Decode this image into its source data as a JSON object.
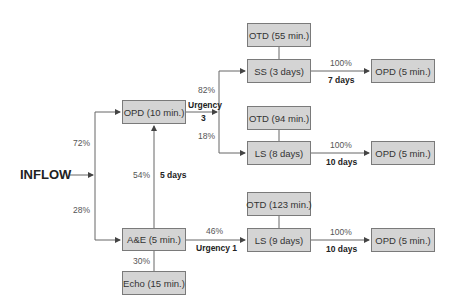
{
  "diagram": {
    "inflow_label": "INFLOW",
    "nodes": {
      "opd_main": "OPD (10 min.)",
      "ae": "A&E (5 min.)",
      "echo": "Echo (15 min.)",
      "otd_55": "OTD (55 min.)",
      "ss": "SS (3 days)",
      "otd_94": "OTD (94 min.)",
      "ls_8": "LS (8 days)",
      "otd_123": "OTD (123 min.)",
      "ls_9": "LS (9 days)",
      "opd_5_a": "OPD (5 min.)",
      "opd_5_b": "OPD (5 min.)",
      "opd_5_c": "OPD (5 min.)"
    },
    "edge_labels": {
      "inflow_to_opd": "72%",
      "inflow_to_ae": "28%",
      "ae_to_opd_pct": "54%",
      "ae_to_opd_time": "5 days",
      "opd_urgency": "Urgency",
      "opd_urgency_level": "3",
      "opd_to_ss": "82%",
      "opd_to_ls8": "18%",
      "ss_to_opd_pct": "100%",
      "ss_to_opd_time": "7 days",
      "ls8_to_opd_pct": "100%",
      "ls8_to_opd_time": "10 days",
      "ae_to_ls9_pct": "46%",
      "ae_to_ls9_urgency": "Urgency 1",
      "ls9_to_opd_pct": "100%",
      "ls9_to_opd_time": "10 days",
      "ae_to_echo": "30%"
    }
  }
}
